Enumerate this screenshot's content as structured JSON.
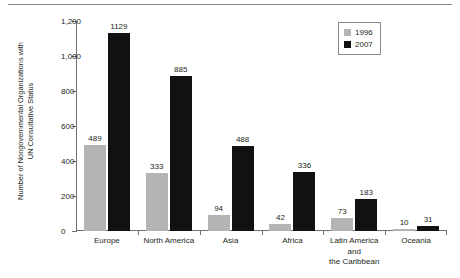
{
  "chart_data": {
    "type": "bar",
    "title": "",
    "xlabel": "",
    "ylabel": "Number of Nongovernmental Organizations with\nUN Consultative Status",
    "ylim": [
      0,
      1200
    ],
    "ytick_labels": [
      "0",
      "200",
      "400",
      "600",
      "800",
      "1,000",
      "1,200"
    ],
    "ytick_values": [
      0,
      200,
      400,
      600,
      800,
      1000,
      1200
    ],
    "grid": false,
    "legend_position": "top-right",
    "categories": [
      "Europe",
      "North America",
      "Asia",
      "Africa",
      "Latin America\nand\nthe Caribbean",
      "Oceania"
    ],
    "series": [
      {
        "name": "1996",
        "color": "#b4b4b4",
        "values": [
          489,
          333,
          94,
          42,
          73,
          10
        ],
        "labels": [
          "489",
          "333",
          "94",
          "42",
          "73",
          "10"
        ]
      },
      {
        "name": "2007",
        "color": "#111111",
        "values": [
          1129,
          885,
          488,
          336,
          183,
          31
        ],
        "labels": [
          "1129",
          "885",
          "488",
          "336",
          "183",
          "31"
        ]
      }
    ]
  },
  "legend": {
    "items": [
      {
        "label": "1996",
        "color": "#b4b4b4"
      },
      {
        "label": "2007",
        "color": "#111111"
      }
    ]
  }
}
